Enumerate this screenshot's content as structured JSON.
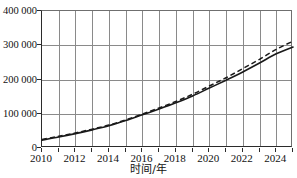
{
  "chart_data": {
    "type": "line",
    "title": "",
    "xlabel": "时间/年",
    "ylabel": "",
    "xlim": [
      2010,
      2025
    ],
    "ylim": [
      0,
      400000
    ],
    "grid": true,
    "legend": "none",
    "x_ticks_major": [
      "2010",
      "2012",
      "2014",
      "2016",
      "2018",
      "2020",
      "2022",
      "2024"
    ],
    "x_ticks_all": [
      "2010",
      "2011",
      "2012",
      "2013",
      "2014",
      "2015",
      "2016",
      "2017",
      "2018",
      "2019",
      "2020",
      "2021",
      "2022",
      "2023",
      "2024",
      "2025"
    ],
    "y_ticks": [
      "0",
      "100 000",
      "200 000",
      "300 000",
      "400 000"
    ],
    "y_tick_values": [
      0,
      100000,
      200000,
      300000,
      400000
    ],
    "x": [
      2010,
      2011,
      2012,
      2013,
      2014,
      2015,
      2016,
      2017,
      2018,
      2019,
      2020,
      2021,
      2022,
      2023,
      2024,
      2025
    ],
    "series": [
      {
        "name": "solid-curve",
        "style": "solid",
        "color": "#1a1a1a",
        "values": [
          23000,
          32000,
          42000,
          53000,
          65000,
          80000,
          97000,
          114000,
          132000,
          152000,
          175000,
          198000,
          222000,
          248000,
          275000,
          295000
        ]
      },
      {
        "name": "dashed-curve",
        "style": "dashed",
        "color": "#1a1a1a",
        "values": [
          25000,
          34000,
          44000,
          55000,
          67000,
          82000,
          99000,
          117000,
          136000,
          157000,
          181000,
          205000,
          232000,
          259000,
          288000,
          312000
        ]
      }
    ]
  }
}
